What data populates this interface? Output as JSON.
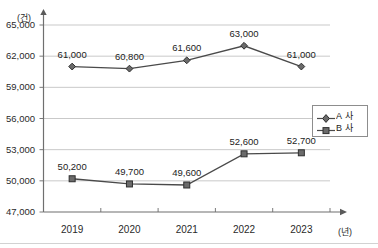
{
  "chart_data": {
    "type": "line",
    "title": "",
    "subtitle": "",
    "xlabel": "(년)",
    "ylabel": "(건)",
    "categories": [
      "2019",
      "2020",
      "2021",
      "2022",
      "2023"
    ],
    "ylim": [
      47000,
      65000
    ],
    "yticks": [
      "47,000",
      "50,000",
      "53,000",
      "56,000",
      "59,000",
      "62,000",
      "65,000"
    ],
    "ytick_values": [
      47000,
      50000,
      53000,
      56000,
      59000,
      62000,
      65000
    ],
    "grid": true,
    "legend_position": "right",
    "series": [
      {
        "name": "A 사",
        "marker": "diamond",
        "color": "#4a4a4a",
        "values": [
          61000,
          60800,
          61600,
          63000,
          61000
        ],
        "labels": [
          "61,000",
          "60,800",
          "61,600",
          "63,000",
          "61,000"
        ]
      },
      {
        "name": "B 사",
        "marker": "square",
        "color": "#4a4a4a",
        "values": [
          50200,
          49700,
          49600,
          52600,
          52700
        ],
        "labels": [
          "50,200",
          "49,700",
          "49,600",
          "52,600",
          "52,700"
        ]
      }
    ]
  },
  "axes": {
    "y_unit": "(건)",
    "x_unit": "(년)"
  },
  "legend": {
    "entries": [
      {
        "label": "A 사",
        "marker": "diamond"
      },
      {
        "label": "B 사",
        "marker": "square"
      }
    ]
  },
  "colors": {
    "line": "#4a4a4a",
    "grid": "#c9c9c9",
    "axis": "#6f6f6f",
    "text": "#1c1c1c"
  }
}
